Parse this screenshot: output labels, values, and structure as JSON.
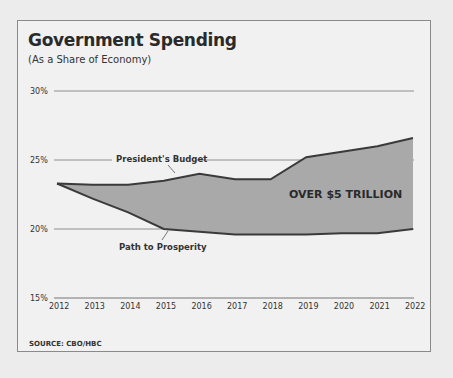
{
  "title": "Government Spending",
  "subtitle": "(As a Share of Economy)",
  "source": "SOURCE: CBO/HBC",
  "chart_data": {
    "type": "area",
    "title": "Government Spending",
    "subtitle": "(As a Share of Economy)",
    "x": [
      2012,
      2013,
      2014,
      2015,
      2016,
      2017,
      2018,
      2019,
      2020,
      2021,
      2022
    ],
    "series": [
      {
        "name": "President's Budget",
        "values": [
          23.3,
          23.2,
          23.2,
          23.5,
          24.0,
          23.6,
          23.6,
          25.2,
          25.6,
          26.0,
          26.6
        ]
      },
      {
        "name": "Path to Prosperity",
        "values": [
          23.3,
          22.2,
          21.2,
          20.0,
          19.8,
          19.6,
          19.6,
          19.6,
          19.7,
          19.7,
          20.0
        ]
      }
    ],
    "fill_between_label": "OVER $5 TRILLION",
    "yticks": [
      "15%",
      "20%",
      "25%",
      "30%"
    ],
    "ylim": [
      15,
      30
    ],
    "xlabel": "",
    "ylabel": "",
    "grid": true,
    "colors": {
      "fill": "#a9a9a9",
      "line": "#3a3a3a",
      "grid": "#777777"
    }
  }
}
